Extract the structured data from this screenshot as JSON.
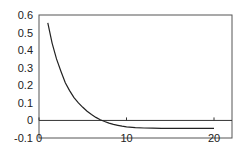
{
  "chart_data": {
    "type": "line",
    "title": "",
    "xlabel": "",
    "ylabel": "",
    "xlim": [
      0,
      22
    ],
    "ylim": [
      -0.1,
      0.6
    ],
    "grid": false,
    "legend": null,
    "x_ticks": [
      "0",
      "10",
      "20"
    ],
    "y_ticks": [
      "0.6",
      "0.5",
      "0.4",
      "0.3",
      "0.2",
      "0.1",
      "0",
      "-0.1"
    ],
    "series": [
      {
        "name": "series-1",
        "color": "#222222",
        "x": [
          1,
          1.5,
          2,
          2.5,
          3,
          3.5,
          4,
          4.5,
          5,
          5.5,
          6,
          6.5,
          7,
          7.5,
          8,
          8.5,
          9,
          9.5,
          10,
          11,
          12,
          13,
          14,
          15,
          16,
          17,
          18,
          19,
          20
        ],
        "y": [
          0.555,
          0.44,
          0.35,
          0.28,
          0.215,
          0.17,
          0.13,
          0.1,
          0.075,
          0.052,
          0.033,
          0.017,
          0.004,
          -0.006,
          -0.015,
          -0.022,
          -0.028,
          -0.033,
          -0.037,
          -0.041,
          -0.043,
          -0.044,
          -0.045,
          -0.045,
          -0.045,
          -0.045,
          -0.045,
          -0.045,
          -0.045
        ]
      }
    ]
  }
}
